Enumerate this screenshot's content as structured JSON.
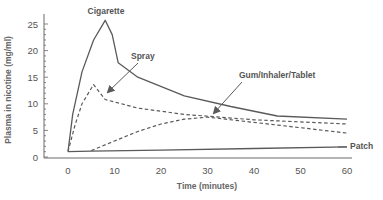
{
  "chart_data": {
    "type": "line",
    "title": "",
    "xlabel": "Time (minutes)",
    "ylabel": "Plasma in nicotine (mg/ml)",
    "xlim": [
      0,
      60
    ],
    "ylim": [
      0,
      25
    ],
    "xticks": [
      0,
      10,
      20,
      30,
      40,
      50,
      60
    ],
    "yticks": [
      0,
      5,
      10,
      15,
      20,
      25
    ],
    "grid": false,
    "legend": "inline annotations",
    "series": [
      {
        "name": "Cigarette",
        "style": "solid",
        "points": [
          [
            0,
            1
          ],
          [
            1,
            8
          ],
          [
            3,
            16
          ],
          [
            5.5,
            22
          ],
          [
            8,
            25.7
          ],
          [
            9.5,
            23
          ],
          [
            10.8,
            17.7
          ],
          [
            15,
            15
          ],
          [
            25,
            11.5
          ],
          [
            35,
            9.5
          ],
          [
            45,
            7.7
          ],
          [
            60,
            7.1
          ]
        ]
      },
      {
        "name": "Spray",
        "style": "dashed",
        "points": [
          [
            0,
            1
          ],
          [
            1.5,
            6
          ],
          [
            3,
            10
          ],
          [
            5.5,
            13.6
          ],
          [
            8,
            10.8
          ],
          [
            15,
            9.2
          ],
          [
            25,
            8
          ],
          [
            40,
            7
          ],
          [
            60,
            6.2
          ]
        ]
      },
      {
        "name": "Gum/Inhaler/Tablet",
        "style": "dashed",
        "points": [
          [
            5,
            1.2
          ],
          [
            10,
            3
          ],
          [
            15,
            4.8
          ],
          [
            20,
            6.2
          ],
          [
            25,
            7.1
          ],
          [
            30,
            7.5
          ],
          [
            40,
            6.5
          ],
          [
            50,
            5.5
          ],
          [
            60,
            4.5
          ]
        ]
      },
      {
        "name": "Patch",
        "style": "solid",
        "points": [
          [
            0,
            1
          ],
          [
            5,
            1.1
          ],
          [
            20,
            1.3
          ],
          [
            40,
            1.6
          ],
          [
            60,
            1.9
          ]
        ]
      }
    ],
    "annotations": [
      {
        "text": "Cigarette",
        "target_series": "Cigarette"
      },
      {
        "text": "Spray",
        "target_series": "Spray",
        "arrow": true
      },
      {
        "text": "Gum/Inhaler/Tablet",
        "target_series": "Gum/Inhaler/Tablet",
        "arrow": true
      },
      {
        "text": "Patch",
        "target_series": "Patch"
      }
    ]
  },
  "labels": {
    "xlabel": "Time (minutes)",
    "ylabel": "Plasma in nicotine (mg/ml)",
    "cigarette": "Cigarette",
    "spray": "Spray",
    "gum": "Gum/Inhaler/Tablet",
    "patch": "Patch",
    "x_ticks": [
      "0",
      "10",
      "20",
      "30",
      "40",
      "50",
      "60"
    ],
    "y_ticks": [
      "0",
      "5",
      "10",
      "15",
      "20",
      "25"
    ]
  },
  "colors": {
    "line": "#5a5a5a",
    "axis": "#6a6a6a",
    "text": "#555555"
  }
}
